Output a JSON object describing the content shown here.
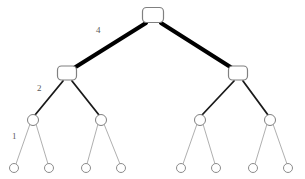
{
  "figure": {
    "background_color": "#ffffff",
    "width": 305,
    "height": 179
  },
  "chart_data": {
    "type": "diagram",
    "subtype": "binary-tree",
    "title": "",
    "xlabel": "",
    "ylabel": "",
    "grid": false,
    "legend": null,
    "levels": 4,
    "nodes": [
      {
        "id": "root",
        "level": 0,
        "shape": "rounded-rect",
        "x": 153,
        "y": 15,
        "w": 21,
        "h": 15,
        "stroke": "#808080",
        "fill": "#ffffff"
      },
      {
        "id": "L1a",
        "level": 1,
        "shape": "rounded-rect",
        "x": 67,
        "y": 73,
        "w": 19,
        "h": 14,
        "stroke": "#808080",
        "fill": "#ffffff"
      },
      {
        "id": "L1b",
        "level": 1,
        "shape": "rounded-rect",
        "x": 238,
        "y": 73,
        "w": 19,
        "h": 14,
        "stroke": "#808080",
        "fill": "#ffffff"
      },
      {
        "id": "L2a",
        "level": 2,
        "shape": "circle",
        "x": 33,
        "y": 120,
        "r": 5.5,
        "stroke": "#808080",
        "fill": "#ffffff"
      },
      {
        "id": "L2b",
        "level": 2,
        "shape": "circle",
        "x": 101,
        "y": 120,
        "r": 5.5,
        "stroke": "#808080",
        "fill": "#ffffff"
      },
      {
        "id": "L2c",
        "level": 2,
        "shape": "circle",
        "x": 200,
        "y": 120,
        "r": 5.5,
        "stroke": "#808080",
        "fill": "#ffffff"
      },
      {
        "id": "L2d",
        "level": 2,
        "shape": "circle",
        "x": 270,
        "y": 120,
        "r": 5.5,
        "stroke": "#808080",
        "fill": "#ffffff"
      },
      {
        "id": "L3a",
        "level": 3,
        "shape": "circle",
        "x": 14,
        "y": 168,
        "r": 4.5,
        "stroke": "#8c8c8c",
        "fill": "#ffffff"
      },
      {
        "id": "L3b",
        "level": 3,
        "shape": "circle",
        "x": 49,
        "y": 168,
        "r": 4.5,
        "stroke": "#8c8c8c",
        "fill": "#ffffff"
      },
      {
        "id": "L3c",
        "level": 3,
        "shape": "circle",
        "x": 86,
        "y": 168,
        "r": 4.5,
        "stroke": "#8c8c8c",
        "fill": "#ffffff"
      },
      {
        "id": "L3d",
        "level": 3,
        "shape": "circle",
        "x": 121,
        "y": 168,
        "r": 4.5,
        "stroke": "#8c8c8c",
        "fill": "#ffffff"
      },
      {
        "id": "L3e",
        "level": 3,
        "shape": "circle",
        "x": 181,
        "y": 168,
        "r": 4.5,
        "stroke": "#8c8c8c",
        "fill": "#ffffff"
      },
      {
        "id": "L3f",
        "level": 3,
        "shape": "circle",
        "x": 216,
        "y": 168,
        "r": 4.5,
        "stroke": "#8c8c8c",
        "fill": "#ffffff"
      },
      {
        "id": "L3g",
        "level": 3,
        "shape": "circle",
        "x": 253,
        "y": 168,
        "r": 4.5,
        "stroke": "#8c8c8c",
        "fill": "#ffffff"
      },
      {
        "id": "L3h",
        "level": 3,
        "shape": "circle",
        "x": 288,
        "y": 168,
        "r": 4.5,
        "stroke": "#8c8c8c",
        "fill": "#ffffff"
      }
    ],
    "edges": [
      {
        "id": "e-root-L1a",
        "from": "root",
        "to": "L1a",
        "x1": 146,
        "y1": 23,
        "x2": 74,
        "y2": 68,
        "width": 4,
        "color": "#000000",
        "label": "4"
      },
      {
        "id": "e-root-L1b",
        "from": "root",
        "to": "L1b",
        "x1": 161,
        "y1": 23,
        "x2": 232,
        "y2": 68,
        "width": 4,
        "color": "#000000",
        "label": ""
      },
      {
        "id": "e-L1a-L2a",
        "from": "L1a",
        "to": "L2a",
        "x1": 63,
        "y1": 81,
        "x2": 35,
        "y2": 115,
        "width": 1.8,
        "color": "#1a1a1a",
        "label": "2"
      },
      {
        "id": "e-L1a-L2b",
        "from": "L1a",
        "to": "L2b",
        "x1": 72,
        "y1": 81,
        "x2": 99,
        "y2": 115,
        "width": 1.8,
        "color": "#1a1a1a",
        "label": ""
      },
      {
        "id": "e-L1b-L2c",
        "from": "L1b",
        "to": "L2c",
        "x1": 234,
        "y1": 81,
        "x2": 202,
        "y2": 115,
        "width": 1.8,
        "color": "#1a1a1a",
        "label": ""
      },
      {
        "id": "e-L1b-L2d",
        "from": "L1b",
        "to": "L2d",
        "x1": 243,
        "y1": 81,
        "x2": 268,
        "y2": 115,
        "width": 1.8,
        "color": "#1a1a1a",
        "label": ""
      },
      {
        "id": "e-L2a-L3a",
        "from": "L2a",
        "to": "L3a",
        "x1": 30,
        "y1": 124,
        "x2": 16,
        "y2": 164,
        "width": 0.8,
        "color": "#9a9a9a",
        "label": "1"
      },
      {
        "id": "e-L2a-L3b",
        "from": "L2a",
        "to": "L3b",
        "x1": 36,
        "y1": 124,
        "x2": 48,
        "y2": 164,
        "width": 0.8,
        "color": "#9a9a9a",
        "label": ""
      },
      {
        "id": "e-L2b-L3c",
        "from": "L2b",
        "to": "L3c",
        "x1": 98,
        "y1": 124,
        "x2": 87,
        "y2": 164,
        "width": 0.8,
        "color": "#9a9a9a",
        "label": ""
      },
      {
        "id": "e-L2b-L3d",
        "from": "L2b",
        "to": "L3d",
        "x1": 104,
        "y1": 124,
        "x2": 120,
        "y2": 164,
        "width": 0.8,
        "color": "#9a9a9a",
        "label": ""
      },
      {
        "id": "e-L2c-L3e",
        "from": "L2c",
        "to": "L3e",
        "x1": 197,
        "y1": 124,
        "x2": 183,
        "y2": 164,
        "width": 0.8,
        "color": "#9a9a9a",
        "label": ""
      },
      {
        "id": "e-L2c-L3f",
        "from": "L2c",
        "to": "L3f",
        "x1": 203,
        "y1": 124,
        "x2": 215,
        "y2": 164,
        "width": 0.8,
        "color": "#9a9a9a",
        "label": ""
      },
      {
        "id": "e-L2d-L3g",
        "from": "L2d",
        "to": "L3g",
        "x1": 267,
        "y1": 124,
        "x2": 255,
        "y2": 164,
        "width": 0.8,
        "color": "#9a9a9a",
        "label": ""
      },
      {
        "id": "e-L2d-L3h",
        "from": "L2d",
        "to": "L3h",
        "x1": 273,
        "y1": 124,
        "x2": 287,
        "y2": 164,
        "width": 0.8,
        "color": "#9a9a9a",
        "label": ""
      }
    ],
    "annotations": [
      {
        "id": "label-4",
        "text": "4",
        "x": 96,
        "y": 26,
        "color": "#5a5a5a",
        "font_size": 9,
        "edge": "e-root-L1a"
      },
      {
        "id": "label-2",
        "text": "2",
        "x": 37,
        "y": 84,
        "color": "#5a5a5a",
        "font_size": 9,
        "edge": "e-L1a-L2a"
      },
      {
        "id": "label-1",
        "text": "1",
        "x": 12,
        "y": 132,
        "color": "#5a5a5a",
        "font_size": 9,
        "edge": "e-L2a-L3a"
      }
    ]
  }
}
